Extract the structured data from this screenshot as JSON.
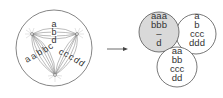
{
  "diagram": {
    "colors": {
      "stroke": "#555555",
      "text": "#333333",
      "shaded": "#d9d9d9",
      "background": "#ffffff"
    },
    "left_graph": {
      "nodes": [
        {
          "id": "top-left",
          "x": 32,
          "y": 34
        },
        {
          "id": "top-right",
          "x": 77,
          "y": 34
        },
        {
          "id": "bottom",
          "x": 55,
          "y": 75
        }
      ],
      "edge_labels": {
        "top": [
          "a",
          "b",
          "d"
        ],
        "left": [
          "a",
          "a",
          "b",
          "b",
          "c"
        ],
        "right": [
          "c",
          "c",
          "c",
          "d",
          "d"
        ]
      }
    },
    "arrow": {
      "direction": "right"
    },
    "right_sets": [
      {
        "name": "shaded-set",
        "shaded": true,
        "lines": [
          "aaa",
          "bbb",
          "–",
          "d"
        ]
      },
      {
        "name": "top-right-set",
        "shaded": false,
        "lines": [
          "a",
          "b",
          "ccc",
          "ddd"
        ]
      },
      {
        "name": "bottom-set",
        "shaded": false,
        "lines": [
          "aa",
          "bb",
          "ccc",
          "dd"
        ]
      }
    ]
  }
}
